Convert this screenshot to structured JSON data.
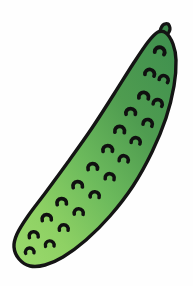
{
  "image": {
    "subject_label": "Cucumber",
    "alt_text": "Clip-art illustration of a single green cucumber",
    "style": "flat clip-art with gradient fill and black outline",
    "width": 193,
    "height": 286,
    "background_color": "#fefefe"
  },
  "colors": {
    "background": "#fefefe",
    "outline": "#141414",
    "skin_dark_green": "#3e8f4e",
    "skin_mid_green": "#5aab55",
    "skin_light_green": "#8ed164",
    "skin_lightest_green": "#9ad96c",
    "spot_color": "#101010",
    "stem_green": "#3c8a4c"
  },
  "geometry": {
    "body_outline_points": "166,33 173,44 176,60 174,86 166,118 152,152 133,186 110,216 86,240 63,257 45,265 30,266 19,259 14,247 17,234 28,216 46,192 68,162 92,128 114,94 133,64 148,42 158,32",
    "outline_stroke_width": 3.4,
    "stem": {
      "label": "stem-nub",
      "points": "160,32 163,25 168,24 170,29 167,34"
    },
    "gradient": {
      "direction": "top-right to bottom-left",
      "stops": [
        {
          "offset": 0,
          "color": "#3e8f4e"
        },
        {
          "offset": 0.32,
          "color": "#4f9c50"
        },
        {
          "offset": 0.58,
          "color": "#6cba5c"
        },
        {
          "offset": 0.82,
          "color": "#8ed164"
        },
        {
          "offset": 1,
          "color": "#9ad96c"
        }
      ]
    }
  },
  "spots": {
    "count": 22,
    "shape": "crescent",
    "items": [
      {
        "cx": 160,
        "cy": 52,
        "r": 5.0,
        "rot": 20
      },
      {
        "cx": 150,
        "cy": 74,
        "r": 4.8,
        "rot": 15
      },
      {
        "cx": 164,
        "cy": 80,
        "r": 4.6,
        "rot": 25
      },
      {
        "cx": 144,
        "cy": 97,
        "r": 4.9,
        "rot": 10
      },
      {
        "cx": 158,
        "cy": 104,
        "r": 4.6,
        "rot": 20
      },
      {
        "cx": 131,
        "cy": 113,
        "r": 4.8,
        "rot": 5
      },
      {
        "cx": 148,
        "cy": 124,
        "r": 4.7,
        "rot": 18
      },
      {
        "cx": 120,
        "cy": 131,
        "r": 4.9,
        "rot": 8
      },
      {
        "cx": 136,
        "cy": 142,
        "r": 4.6,
        "rot": 15
      },
      {
        "cx": 108,
        "cy": 150,
        "r": 4.8,
        "rot": 4
      },
      {
        "cx": 124,
        "cy": 160,
        "r": 4.6,
        "rot": 12
      },
      {
        "cx": 93,
        "cy": 168,
        "r": 4.8,
        "rot": 2
      },
      {
        "cx": 110,
        "cy": 178,
        "r": 4.6,
        "rot": 10
      },
      {
        "cx": 78,
        "cy": 186,
        "r": 4.8,
        "rot": 0
      },
      {
        "cx": 95,
        "cy": 196,
        "r": 4.6,
        "rot": 8
      },
      {
        "cx": 62,
        "cy": 203,
        "r": 4.8,
        "rot": 0
      },
      {
        "cx": 79,
        "cy": 213,
        "r": 4.6,
        "rot": 6
      },
      {
        "cx": 47,
        "cy": 219,
        "r": 4.7,
        "rot": 0
      },
      {
        "cx": 64,
        "cy": 229,
        "r": 4.5,
        "rot": 4
      },
      {
        "cx": 34,
        "cy": 236,
        "r": 4.6,
        "rot": 0
      },
      {
        "cx": 50,
        "cy": 245,
        "r": 4.4,
        "rot": 2
      },
      {
        "cx": 30,
        "cy": 252,
        "r": 4.3,
        "rot": 0
      }
    ]
  }
}
